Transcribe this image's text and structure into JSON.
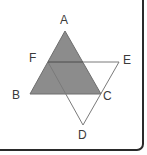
{
  "figure": {
    "shaded_color": "#8a8a8a",
    "line_color": "#777777",
    "points": {
      "A": {
        "x": 65,
        "y": 31
      },
      "B": {
        "x": 30,
        "y": 94
      },
      "C": {
        "x": 101,
        "y": 94
      },
      "F": {
        "x": 48,
        "y": 62
      },
      "E": {
        "x": 119,
        "y": 62
      },
      "D": {
        "x": 83,
        "y": 125
      }
    },
    "labels": {
      "A": "A",
      "B": "B",
      "C": "C",
      "D": "D",
      "E": "E",
      "F": "F"
    },
    "shaded_triangle": [
      "A",
      "B",
      "C"
    ],
    "outline_triangle": [
      "F",
      "E",
      "D"
    ]
  }
}
